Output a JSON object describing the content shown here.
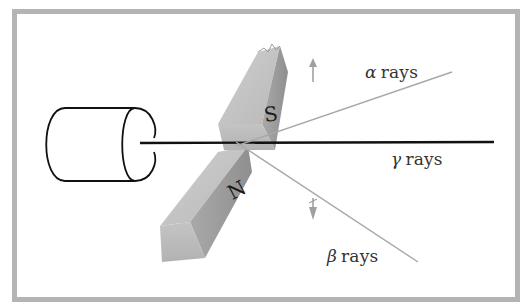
{
  "diagram": {
    "type": "physics-illustration",
    "labels": {
      "alpha": {
        "symbol": "α",
        "text": "rays"
      },
      "gamma": {
        "symbol": "γ",
        "text": "rays"
      },
      "beta": {
        "symbol": "β",
        "text": "rays"
      }
    },
    "magnet_poles": {
      "south": "S",
      "north": "N"
    },
    "components": [
      "radioactive-source-cylinder",
      "magnet-south-pole",
      "magnet-north-pole",
      "gamma-ray-beam",
      "alpha-ray-path",
      "beta-ray-path",
      "alpha-deflection-arrow-up",
      "beta-deflection-arrow-down"
    ],
    "colors": {
      "frame": "#b4b4b4",
      "beam": "#111111",
      "deflected_rays": "#a8a8a8",
      "magnet_light": "#d8d8d8",
      "magnet_mid": "#bdbdbd",
      "magnet_dark": "#9a9a9a"
    }
  }
}
